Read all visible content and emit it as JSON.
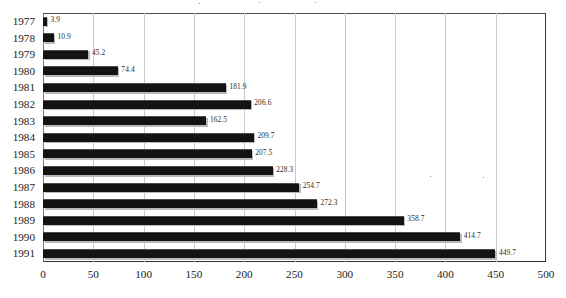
{
  "chart_data": {
    "type": "bar",
    "orientation": "horizontal",
    "title": "",
    "xlabel": "",
    "ylabel": "",
    "categories": [
      "1977",
      "1978",
      "1979",
      "1980",
      "1981",
      "1982",
      "1983",
      "1984",
      "1985",
      "1986",
      "1987",
      "1988",
      "1989",
      "1990",
      "1991"
    ],
    "values": [
      3.9,
      10.9,
      45.2,
      74.4,
      181.9,
      206.6,
      162.5,
      209.7,
      207.5,
      228.3,
      254.7,
      272.3,
      358.7,
      414.7,
      449.7
    ],
    "value_labels": [
      "3.9",
      "10.9",
      "45.2",
      "74.4",
      "181.9",
      "206.6",
      "162.5",
      "209.7",
      "207.5",
      "228.3",
      "254.7",
      "272.3",
      "358.7",
      "414.7",
      "449.7"
    ],
    "xlim": [
      0,
      500
    ],
    "xticks": [
      0,
      50,
      100,
      150,
      200,
      250,
      300,
      350,
      400,
      450,
      500
    ],
    "xtick_labels": [
      "0",
      "50",
      "100",
      "150",
      "200",
      "250",
      "300",
      "350",
      "400",
      "450",
      "500"
    ],
    "grid": "vertical",
    "legend": null,
    "bar_color": "#131313",
    "grid_color": "#c9c9c9",
    "frame_color": "#3a3a3a",
    "background": "#ffffff",
    "data_labels_shown": true
  }
}
